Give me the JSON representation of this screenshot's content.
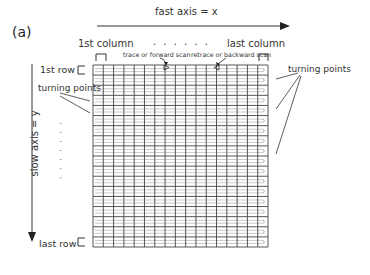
{
  "figure": {
    "panel_label": "(a)",
    "fast_axis_label": "fast axis = x",
    "slow_axis_label": "slow axis = y",
    "first_column_label": "1st column",
    "last_column_label": "last column",
    "first_row_label": "1st row",
    "last_row_label": "last row",
    "trace_label": "trace or forward scan",
    "retrace_label": "retrace or backward scan",
    "turning_points_left_label": "turning points",
    "turning_points_right_label": "turning points",
    "ellipsis_horizontal": ". . . . . .",
    "ellipsis_vertical": ". . . . . . ."
  },
  "grid": {
    "columns": 17,
    "rows": 18,
    "line_color": "#444444",
    "trace_color": "#bbbbbb"
  }
}
